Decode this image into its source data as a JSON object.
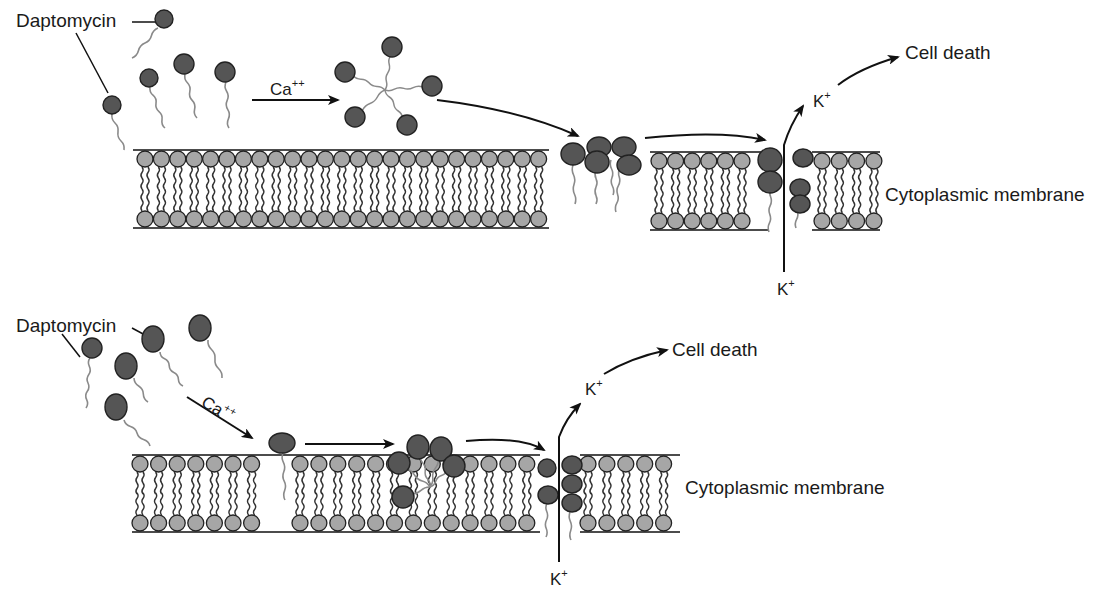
{
  "figure": {
    "colors": {
      "background": "#ffffff",
      "lipid_head": "#a6a6a6",
      "daptomycin_head": "#555555",
      "outline": "#222222",
      "tail": "#8a8a8a",
      "lipid_tail": "#333333",
      "line": "#111111"
    }
  },
  "top_panel": {
    "drug_label": "Daptomycin",
    "calcium_label": "Ca",
    "calcium_charge": "++",
    "ion_outside_label": "K",
    "ion_outside_charge": "+",
    "ion_inside_label": "K",
    "ion_inside_charge": "+",
    "outcome_label": "Cell death",
    "membrane_label": "Cytoplasmic membrane"
  },
  "bottom_panel": {
    "drug_label": "Daptomycin",
    "calcium_label": "Ca",
    "calcium_charge": "++",
    "ion_outside_label": "K",
    "ion_outside_charge": "+",
    "ion_inside_label": "K",
    "ion_inside_charge": "+",
    "outcome_label": "Cell death",
    "membrane_label": "Cytoplasmic membrane"
  }
}
